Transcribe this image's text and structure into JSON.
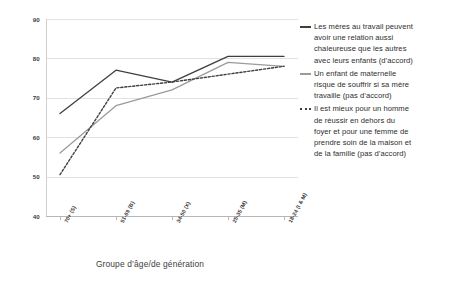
{
  "chart_data": {
    "type": "line",
    "title": "",
    "xlabel": "Groupe d’âge/de génération",
    "ylabel": "",
    "ylim": [
      40,
      90
    ],
    "yticks": [
      40,
      50,
      60,
      70,
      80,
      90
    ],
    "grid": true,
    "legend_position": "right",
    "categories": [
      "70+ (S)",
      "51-69 (B)",
      "34-50 (X)",
      "25-35 (M)",
      "18-24 (I & M)"
    ],
    "series": [
      {
        "name": "Les mères au travail peuvent avoir une relation aussi chaleureuse que les autres avec leurs enfants (d’accord)",
        "style": "solid",
        "color": "#3f3f3f",
        "values": [
          66,
          77,
          74,
          80.5,
          80.5
        ]
      },
      {
        "name": "Un enfant de maternelle risque de souffrir si sa mère travaille (pas d’accord)",
        "style": "solid",
        "color": "#9b9b9b",
        "values": [
          56,
          68,
          72,
          79,
          78
        ]
      },
      {
        "name": "Il est mieux pour un homme de réussir en dehors du foyer et pour une femme de prendre soin de la maison et de la famille (pas d’accord)",
        "style": "dashed",
        "color": "#3f3f3f",
        "values": [
          50.5,
          72.5,
          74,
          76,
          78
        ]
      }
    ]
  },
  "legend": {
    "entries": [
      {
        "marker": "solid-dark",
        "lines": [
          "Les mères au travail peuvent",
          "avoir une relation aussi",
          "chaleureuse que les autres",
          "avec leurs enfants (d’accord)"
        ]
      },
      {
        "marker": "solid-gray",
        "lines": [
          "Un enfant de maternelle",
          "risque de souffrir si sa mère",
          "travaille (pas d’accord)"
        ]
      },
      {
        "marker": "dashed",
        "lines": [
          "Il est mieux pour un homme",
          "de réussir en dehors du",
          "foyer et pour une femme de",
          "prendre soin de la maison et",
          "de la famille (pas d’accord)"
        ]
      }
    ]
  }
}
